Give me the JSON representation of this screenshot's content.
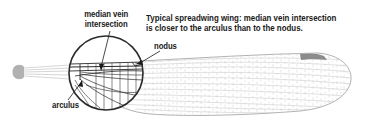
{
  "figure": {
    "caption": {
      "line1": "Typical spreadwing wing: median vein intersection",
      "line2": "is closer to the arculus than to the nodus."
    },
    "labels": {
      "median_vein_line1": "median vein",
      "median_vein_line2": "intersection",
      "nodus": "nodus",
      "arculus": "arculus"
    },
    "colors": {
      "wing_vein": "#b8b8b8",
      "main_vein": "#9a9a9a",
      "stigma": "#8c8c8c",
      "circle_outline": "#2a2a2a",
      "text": "#1a1a1a",
      "background": "#ffffff"
    }
  }
}
